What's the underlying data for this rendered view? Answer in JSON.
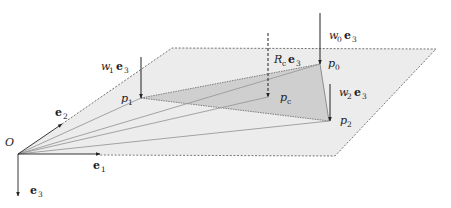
{
  "diagram": {
    "colors": {
      "plane_fill": "#ececec",
      "triangle_fill": "#cfcfcf",
      "line": "#222222",
      "ray": "#9a9a9a",
      "dashed_edge": "#555555"
    },
    "origin": {
      "label": "O",
      "x": 18,
      "y": 154
    },
    "axes": {
      "e1": {
        "name": "e",
        "sub": "1"
      },
      "e2": {
        "name": "e",
        "sub": "2"
      },
      "e3": {
        "name": "e",
        "sub": "3"
      }
    },
    "points": [
      {
        "id": "p0",
        "name": "p",
        "sub": "0",
        "force": {
          "w": "w",
          "wsub": "0",
          "e": "e",
          "esub": "3"
        }
      },
      {
        "id": "p1",
        "name": "p",
        "sub": "1",
        "force": {
          "w": "w",
          "wsub": "1",
          "e": "e",
          "esub": "3"
        }
      },
      {
        "id": "p2",
        "name": "p",
        "sub": "2",
        "force": {
          "w": "w",
          "wsub": "2",
          "e": "e",
          "esub": "3"
        }
      },
      {
        "id": "pc",
        "name": "p",
        "sub": "c",
        "force": {
          "w": "R",
          "wsub": "c",
          "e": "e",
          "esub": "3"
        }
      }
    ]
  }
}
